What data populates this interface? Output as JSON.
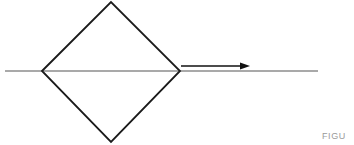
{
  "figure": {
    "width": 354,
    "height": 145,
    "background_color": "#ffffff",
    "caption": "FIGU",
    "caption_color": "#9a9a9a",
    "elements": {
      "axis_line": {
        "name": "horizontal-axis-line",
        "color": "#8c8c8c",
        "stroke_width": 1.6,
        "x1": 5,
        "y1": 71,
        "x2": 318,
        "y2": 71
      },
      "diamond": {
        "name": "diamond-outline",
        "color": "#1a1a1a",
        "stroke_width": 1.8,
        "fill": "none",
        "left_vertex": [
          42,
          71
        ],
        "top_vertex": [
          111,
          2
        ],
        "right_vertex": [
          180,
          71
        ],
        "bottom_vertex": [
          111,
          142
        ]
      },
      "arrow": {
        "name": "direction-arrow",
        "color": "#111111",
        "stroke_width": 1.6,
        "x1": 181,
        "y1": 66,
        "x2": 250,
        "y2": 66,
        "head_length": 9,
        "head_width": 7
      }
    }
  }
}
